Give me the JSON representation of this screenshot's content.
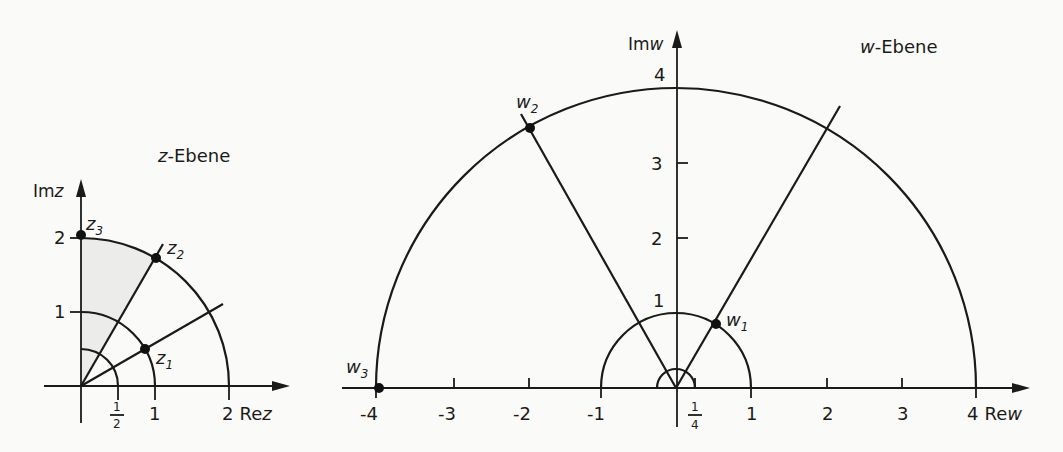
{
  "z_plane": {
    "title": "z-Ebene",
    "title_italic": "z",
    "title_rest": "-Ebene",
    "axis_x_label": "Re",
    "axis_x_var": "z",
    "axis_y_label": "Im",
    "axis_y_var": "z",
    "x_ticks": [
      {
        "num": "1",
        "den": "2",
        "value": 0.5,
        "fraction": true
      },
      {
        "label": "1",
        "value": 1
      },
      {
        "label": "2",
        "value": 2
      }
    ],
    "y_ticks": [
      {
        "label": "1",
        "value": 1
      },
      {
        "label": "2",
        "value": 2
      }
    ],
    "points": [
      {
        "name": "z",
        "sub": "1",
        "r": 1,
        "angle_deg": 30
      },
      {
        "name": "z",
        "sub": "2",
        "r": 2,
        "angle_deg": 60
      },
      {
        "name": "z",
        "sub": "3",
        "r": 2,
        "angle_deg": 90
      }
    ],
    "arcs_radii": [
      0.5,
      1,
      2
    ],
    "rays_deg": [
      30,
      60
    ]
  },
  "w_plane": {
    "title": "w-Ebene",
    "title_italic": "w",
    "title_rest": "-Ebene",
    "axis_x_label": "Re",
    "axis_x_var": "w",
    "axis_y_label": "Im",
    "axis_y_var": "w",
    "x_ticks": [
      {
        "label": "-4",
        "value": -4
      },
      {
        "label": "-3",
        "value": -3
      },
      {
        "label": "-2",
        "value": -2
      },
      {
        "label": "-1",
        "value": -1
      },
      {
        "num": "1",
        "den": "4",
        "value": 0.25,
        "fraction": true
      },
      {
        "label": "1",
        "value": 1
      },
      {
        "label": "2",
        "value": 2
      },
      {
        "label": "3",
        "value": 3
      },
      {
        "label": "4",
        "value": 4
      }
    ],
    "y_ticks": [
      {
        "label": "1",
        "value": 1
      },
      {
        "label": "2",
        "value": 2
      },
      {
        "label": "3",
        "value": 3
      },
      {
        "label": "4",
        "value": 4
      }
    ],
    "points": [
      {
        "name": "w",
        "sub": "1",
        "r": 1,
        "angle_deg": 60
      },
      {
        "name": "w",
        "sub": "2",
        "r": 4,
        "angle_deg": 120
      },
      {
        "name": "w",
        "sub": "3",
        "r": 4,
        "angle_deg": 180
      }
    ],
    "arcs_radii": [
      0.25,
      1,
      4
    ],
    "rays_deg": [
      60,
      120
    ]
  },
  "mapping": "w = z^2"
}
